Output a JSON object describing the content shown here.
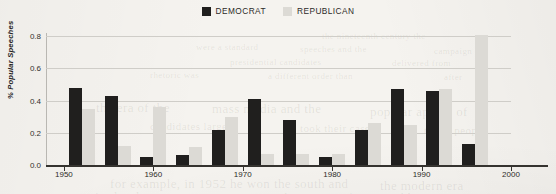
{
  "legend": {
    "items": [
      {
        "label": "DEMOCRAT",
        "color": "#201f1e",
        "icon": "square-swatch-icon"
      },
      {
        "label": "REPUBLICAN",
        "color": "#dcdad5",
        "icon": "square-swatch-icon"
      }
    ]
  },
  "axes": {
    "y_title": "% Popular Speeches",
    "y_ticks": [
      "0.0",
      "0.2",
      "0.4",
      "0.6",
      "0.8"
    ],
    "x_ticks": [
      "1950",
      "1960",
      "1970",
      "1980",
      "1990",
      "2000"
    ]
  },
  "page_bleed": [
    {
      "text": "the nineteenth century the",
      "x": 322,
      "y": 31,
      "size": 9
    },
    {
      "text": "were a standard",
      "x": 196,
      "y": 42,
      "size": 9
    },
    {
      "text": "speeches and the",
      "x": 300,
      "y": 44,
      "size": 9
    },
    {
      "text": "campaign of",
      "x": 434,
      "y": 46,
      "size": 9
    },
    {
      "text": "presidential candidates",
      "x": 230,
      "y": 57,
      "size": 9
    },
    {
      "text": "delivered from",
      "x": 392,
      "y": 58,
      "size": 9
    },
    {
      "text": "rhetoric was",
      "x": 150,
      "y": 70,
      "size": 9
    },
    {
      "text": "a different order than",
      "x": 268,
      "y": 71,
      "size": 9
    },
    {
      "text": "after",
      "x": 444,
      "y": 72,
      "size": 9
    },
    {
      "text": "the era of the",
      "x": 96,
      "y": 100,
      "size": 13
    },
    {
      "text": "mass media and the",
      "x": 212,
      "y": 101,
      "size": 13
    },
    {
      "text": "popular appeal of",
      "x": 370,
      "y": 104,
      "size": 13
    },
    {
      "text": "candidates largely",
      "x": 150,
      "y": 120,
      "size": 11
    },
    {
      "text": "took their case",
      "x": 300,
      "y": 122,
      "size": 11
    },
    {
      "text": "to the people",
      "x": 424,
      "y": 124,
      "size": 11
    },
    {
      "text": "for example, in 1952 he won the south and",
      "x": 110,
      "y": 176,
      "size": 13
    },
    {
      "text": "the modern era",
      "x": 380,
      "y": 178,
      "size": 13
    },
    {
      "text": "a sustained and",
      "x": 60,
      "y": 190,
      "size": 12
    },
    {
      "text": "nationwide strategy of going public",
      "x": 236,
      "y": 191,
      "size": 12
    }
  ],
  "chart_data": {
    "type": "bar",
    "title": "",
    "xlabel": "",
    "ylabel": "% Popular Speeches",
    "ylim": [
      0.0,
      0.82
    ],
    "xlim": [
      1948,
      2000
    ],
    "grid": true,
    "legend_position": "top-center",
    "categories": [
      1952,
      1956,
      1960,
      1964,
      1968,
      1972,
      1976,
      1980,
      1984,
      1988,
      1992,
      1996
    ],
    "series": [
      {
        "name": "DEMOCRAT",
        "color": "#201f1e",
        "values": [
          0.48,
          0.43,
          0.05,
          0.06,
          0.22,
          0.41,
          0.28,
          0.05,
          0.22,
          0.47,
          0.46,
          0.13
        ]
      },
      {
        "name": "REPUBLICAN",
        "color": "#dcdad5",
        "values": [
          0.35,
          0.12,
          0.36,
          0.11,
          0.3,
          0.07,
          0.07,
          0.07,
          0.26,
          0.25,
          0.47,
          0.81
        ]
      }
    ]
  }
}
